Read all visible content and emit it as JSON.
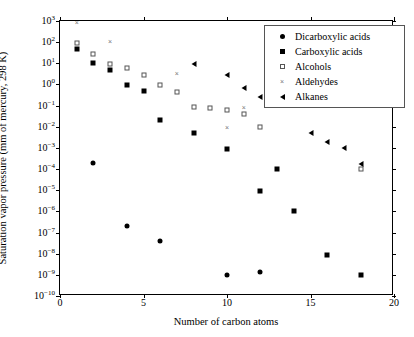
{
  "chart_data": {
    "type": "scatter",
    "title": "",
    "xlabel": "Number of carbon atoms",
    "ylabel": "Saturation vapor pressure (mm of mercury, 298 K)",
    "xlim": [
      0,
      20
    ],
    "ylim": [
      1e-10,
      1000
    ],
    "yscale": "log",
    "grid": false,
    "legend_position": "top-right",
    "xticks": [
      "0",
      "5",
      "10",
      "15",
      "20"
    ],
    "xtick_values": [
      0,
      5,
      10,
      15,
      20
    ],
    "yticks": [
      "10^3",
      "10^2",
      "10^1",
      "10^0",
      "10^-1",
      "10^-2",
      "10^-3",
      "10^-4",
      "10^-5",
      "10^-6",
      "10^-7",
      "10^-8",
      "10^-9",
      "10^-10"
    ],
    "ytick_exponents": [
      3,
      2,
      1,
      0,
      -1,
      -2,
      -3,
      -4,
      -5,
      -6,
      -7,
      -8,
      -9,
      -10
    ],
    "series": [
      {
        "name": "Dicarboxylic acids",
        "marker": "filled-circle",
        "x": [
          2,
          4,
          6,
          10,
          12
        ],
        "y": [
          0.0002,
          2e-07,
          4e-08,
          1e-09,
          1.4e-09
        ]
      },
      {
        "name": "Carboxylic acids",
        "marker": "filled-square",
        "x": [
          1,
          2,
          3,
          4,
          5,
          6,
          8,
          10,
          12,
          13,
          14,
          16,
          18
        ],
        "y": [
          50,
          10,
          5,
          0.9,
          0.47,
          0.02,
          0.005,
          0.0009,
          9e-06,
          0.0001,
          1e-06,
          9e-09,
          1e-09
        ]
      },
      {
        "name": "Alcohols",
        "marker": "open-square",
        "x": [
          1,
          2,
          3,
          4,
          5,
          6,
          7,
          8,
          9,
          10,
          11,
          12,
          18
        ],
        "y": [
          95,
          27,
          9,
          6,
          2.7,
          0.9,
          0.45,
          0.09,
          0.08,
          0.06,
          0.04,
          0.01,
          0.0001
        ]
      },
      {
        "name": "Aldehydes",
        "marker": "cross",
        "x": [
          1,
          3,
          7,
          10,
          11
        ],
        "y": [
          900,
          110,
          3.5,
          0.01,
          0.09
        ]
      },
      {
        "name": "Alkanes",
        "marker": "left-triangle",
        "x": [
          8,
          10,
          11,
          12,
          15,
          16,
          17,
          18
        ],
        "y": [
          9,
          2.8,
          0.7,
          0.26,
          0.005,
          0.002,
          0.001,
          0.00017
        ]
      }
    ]
  },
  "legend": {
    "entries": [
      {
        "label": "Dicarboxylic acids",
        "marker": "filled-circle"
      },
      {
        "label": "Carboxylic acids",
        "marker": "filled-square"
      },
      {
        "label": "Alcohols",
        "marker": "open-square"
      },
      {
        "label": "Aldehydes",
        "marker": "cross"
      },
      {
        "label": "Alkanes",
        "marker": "left-triangle"
      }
    ]
  },
  "glyphs": {
    "cross": "×"
  },
  "colors": {
    "axis": "#000000",
    "background": "#ffffff",
    "filled_marker": "#000000",
    "open_marker_edge": "#555555",
    "cross_marker": "#777777"
  }
}
